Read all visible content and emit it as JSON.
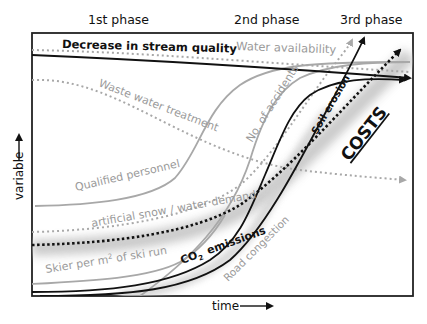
{
  "diagram": {
    "phases": [
      "1st phase",
      "2nd phase",
      "3rd phase"
    ],
    "axes": {
      "x_label": "time",
      "y_label": "variable"
    },
    "series": {
      "stream_quality": "Decrease in stream quality",
      "water_availability": "Water availability",
      "waste_water": "Waste water treatment",
      "accidents": "No. of accidents",
      "qualified_personnel": "Qualified personnel",
      "artificial_snow": "artificial snow /  water  demand",
      "skier_density_prefix": "Skier per m",
      "skier_density_sup": "2",
      "skier_density_suffix": " of ski run",
      "co2_prefix": "CO",
      "co2_sub": "2",
      "co2_suffix": "emissions",
      "road_congestion": "Road congestion",
      "soil_erosion": "Soil erosion",
      "costs": "COSTS"
    },
    "colors": {
      "dark": "#111111",
      "gray": "#9a9a9a",
      "shadow": "#c8c8c8"
    }
  }
}
